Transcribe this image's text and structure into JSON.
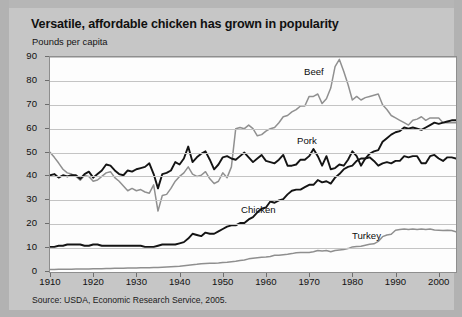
{
  "title": "Versatile, affordable chicken has grown in popularity",
  "axis_title": "Pounds per capita",
  "source": "Source: USDA, Economic Research Service, 2005.",
  "colors": {
    "panel_background": "#c6c6c6",
    "plot_background": "#fdfdfd",
    "gridline": "#c4c4c4",
    "beef_line": "#909090",
    "turkey_line": "#8f8f8f",
    "pork_line": "#141414",
    "chicken_line": "#141414",
    "text": "#101010"
  },
  "series_labels": {
    "beef": "Beef",
    "pork": "Pork",
    "chicken": "Chicken",
    "turkey": "Turkey"
  },
  "chart_data": {
    "type": "line",
    "title": "Versatile, affordable chicken has grown in popularity",
    "subtitle": "Pounds per capita",
    "xlabel": "",
    "ylabel": "Pounds per capita",
    "xlim": [
      1910,
      2004
    ],
    "ylim": [
      0,
      90
    ],
    "ytick_values": [
      0,
      10,
      20,
      30,
      40,
      50,
      60,
      70,
      80,
      90
    ],
    "xtick_values": [
      1910,
      1920,
      1930,
      1940,
      1950,
      1960,
      1970,
      1980,
      1990,
      2000
    ],
    "grid": true,
    "legend_position": "inline-labels",
    "source": "Source: USDA, Economic Research Service, 2005.",
    "x": [
      1910,
      1911,
      1912,
      1913,
      1914,
      1915,
      1916,
      1917,
      1918,
      1919,
      1920,
      1921,
      1922,
      1923,
      1924,
      1925,
      1926,
      1927,
      1928,
      1929,
      1930,
      1931,
      1932,
      1933,
      1934,
      1935,
      1936,
      1937,
      1938,
      1939,
      1940,
      1941,
      1942,
      1943,
      1944,
      1945,
      1946,
      1947,
      1948,
      1949,
      1950,
      1951,
      1952,
      1953,
      1954,
      1955,
      1956,
      1957,
      1958,
      1959,
      1960,
      1961,
      1962,
      1963,
      1964,
      1965,
      1966,
      1967,
      1968,
      1969,
      1970,
      1971,
      1972,
      1973,
      1974,
      1975,
      1976,
      1977,
      1978,
      1979,
      1980,
      1981,
      1982,
      1983,
      1984,
      1985,
      1986,
      1987,
      1988,
      1989,
      1990,
      1991,
      1992,
      1993,
      1994,
      1995,
      1996,
      1997,
      1998,
      1999,
      2000,
      2001,
      2002,
      2003,
      2004
    ],
    "series": [
      {
        "name": "Beef",
        "color": "#909090",
        "values": [
          50.1,
          48.0,
          45.6,
          43.0,
          41.5,
          41.0,
          40.0,
          38.4,
          40.4,
          40.0,
          38.0,
          38.5,
          40.0,
          41.5,
          42.0,
          39.5,
          38.0,
          36.0,
          34.0,
          35.0,
          34.0,
          34.5,
          33.5,
          33.0,
          36.5,
          25.5,
          32.0,
          32.5,
          35.0,
          38.0,
          40.0,
          41.5,
          44.0,
          41.0,
          40.0,
          40.5,
          42.0,
          39.0,
          37.0,
          38.0,
          41.5,
          39.5,
          44.0,
          60.0,
          60.5,
          60.0,
          61.5,
          60.0,
          57.0,
          57.5,
          59.0,
          60.0,
          60.5,
          62.5,
          65.0,
          65.5,
          67.0,
          68.0,
          69.5,
          69.5,
          73.5,
          73.5,
          74.5,
          70.5,
          72.5,
          77.0,
          86.0,
          89.0,
          84.0,
          78.5,
          72.0,
          73.5,
          72.0,
          73.0,
          73.5,
          74.0,
          74.5,
          70.0,
          68.0,
          65.5,
          64.5,
          63.5,
          62.5,
          61.5,
          63.5,
          64.0,
          65.0,
          63.5,
          64.5,
          64.5,
          64.5,
          62.5,
          62.5,
          62.5,
          62.5
        ]
      },
      {
        "name": "Pork",
        "color": "#141414",
        "values": [
          40.5,
          41.0,
          39.5,
          40.5,
          40.0,
          40.5,
          40.5,
          39.0,
          41.0,
          42.0,
          39.5,
          41.0,
          42.5,
          45.0,
          44.5,
          42.5,
          41.0,
          40.5,
          42.5,
          42.0,
          43.0,
          43.5,
          44.0,
          45.5,
          41.0,
          35.0,
          41.0,
          41.5,
          42.5,
          46.0,
          45.0,
          47.5,
          52.5,
          46.0,
          48.0,
          49.5,
          50.5,
          47.0,
          43.0,
          45.0,
          48.0,
          48.5,
          47.5,
          47.0,
          48.5,
          50.0,
          48.0,
          46.0,
          47.5,
          49.0,
          46.5,
          46.0,
          45.5,
          47.0,
          49.0,
          44.5,
          44.5,
          45.0,
          47.0,
          47.0,
          48.5,
          51.5,
          48.5,
          44.5,
          48.5,
          43.0,
          43.5,
          45.0,
          44.5,
          47.0,
          50.5,
          48.5,
          44.5,
          47.5,
          48.0,
          46.5,
          44.5,
          45.5,
          46.0,
          45.5,
          46.5,
          46.5,
          48.5,
          48.0,
          48.5,
          48.5,
          45.5,
          45.5,
          48.5,
          49.0,
          47.5,
          46.5,
          48.0,
          48.0,
          47.5
        ]
      },
      {
        "name": "Chicken",
        "color": "#141414",
        "values": [
          10.5,
          10.5,
          11.0,
          11.0,
          11.5,
          11.5,
          11.5,
          11.5,
          11.0,
          11.0,
          11.5,
          11.5,
          11.0,
          11.0,
          11.0,
          11.0,
          11.0,
          11.0,
          11.0,
          11.0,
          11.0,
          11.0,
          10.5,
          10.5,
          10.5,
          11.0,
          11.5,
          11.5,
          11.5,
          11.5,
          12.0,
          12.5,
          14.0,
          16.0,
          15.5,
          15.0,
          16.5,
          16.0,
          16.0,
          17.0,
          18.0,
          19.0,
          19.5,
          19.5,
          20.5,
          20.5,
          22.0,
          23.0,
          25.0,
          26.5,
          27.0,
          29.5,
          29.0,
          30.0,
          30.5,
          32.5,
          34.0,
          34.5,
          34.5,
          35.5,
          36.5,
          36.5,
          38.5,
          37.5,
          38.0,
          37.0,
          39.5,
          41.0,
          43.0,
          44.0,
          44.5,
          46.5,
          47.5,
          47.5,
          49.5,
          50.5,
          51.0,
          54.5,
          56.0,
          57.5,
          58.5,
          59.0,
          60.5,
          60.0,
          60.5,
          60.0,
          59.5,
          60.5,
          61.5,
          62.5,
          62.0,
          62.5,
          63.0,
          63.5,
          63.5
        ]
      },
      {
        "name": "Turkey",
        "color": "#8f8f8f",
        "values": [
          1.0,
          1.0,
          1.2,
          1.2,
          1.2,
          1.2,
          1.3,
          1.3,
          1.3,
          1.3,
          1.4,
          1.4,
          1.4,
          1.5,
          1.5,
          1.6,
          1.6,
          1.6,
          1.7,
          1.7,
          1.7,
          1.8,
          1.8,
          1.8,
          1.9,
          1.9,
          2.0,
          2.1,
          2.2,
          2.3,
          2.4,
          2.6,
          2.8,
          3.0,
          3.2,
          3.5,
          3.6,
          3.7,
          3.7,
          3.8,
          4.0,
          4.1,
          4.3,
          4.5,
          4.8,
          5.0,
          5.5,
          5.8,
          6.0,
          6.2,
          6.3,
          6.5,
          7.0,
          7.0,
          7.2,
          7.4,
          7.7,
          8.1,
          8.2,
          8.2,
          8.2,
          8.5,
          9.0,
          8.8,
          9.0,
          8.5,
          9.0,
          9.2,
          9.4,
          9.8,
          10.5,
          10.7,
          10.8,
          11.2,
          11.6,
          11.8,
          12.8,
          14.8,
          15.5,
          15.8,
          17.5,
          17.8,
          18.0,
          17.8,
          18.0,
          17.8,
          18.0,
          17.8,
          18.0,
          17.6,
          17.5,
          17.4,
          17.5,
          17.4,
          16.8
        ]
      }
    ]
  }
}
